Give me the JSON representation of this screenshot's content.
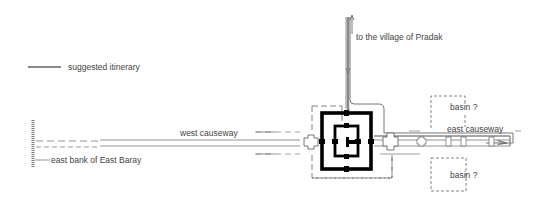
{
  "legend": {
    "line_color": "#8a8a8a",
    "label": "suggested itinerary"
  },
  "labels": {
    "north_route": "to the village of Pradak",
    "basin_north": "basin ?",
    "basin_south": "basin ?",
    "west_causeway": "west causeway",
    "east_causeway": "east causeway",
    "east_bank": "east bank of East Baray"
  },
  "colors": {
    "structure": "#000000",
    "outline": "#555555",
    "itinerary": "#8a8a8a",
    "text": "#444444"
  }
}
